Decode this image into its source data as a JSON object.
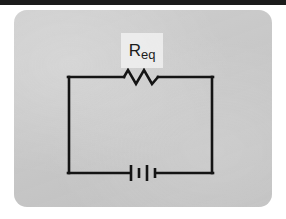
{
  "figure": {
    "kind": "circuit-diagram",
    "card_color": "#c9c9c9",
    "wire_color": "#141414",
    "top_bar_color": "#1b1b1b",
    "label_highlight_color": "#eeeeee"
  },
  "components": {
    "resistor": {
      "label_main": "R",
      "label_sub": "eq",
      "symbol": "zigzag",
      "zigzag_peaks": 4,
      "position": "top-wire-center"
    },
    "battery": {
      "symbol": "battery-cells",
      "plate_count": 4,
      "plate_pattern": "long-short-long-short",
      "position": "bottom-wire-center"
    }
  },
  "loop": {
    "left_x": 68,
    "right_x": 213,
    "top_y": 77,
    "bottom_y": 173
  }
}
